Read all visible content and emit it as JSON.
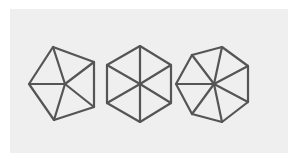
{
  "diagram": {
    "background_color": "#efefef",
    "stroke_color": "#555555",
    "shapes": [
      {
        "name": "pentagon",
        "sides": 5,
        "center": [
          65,
          84
        ],
        "vertices": [
          [
            53,
            47
          ],
          [
            94,
            62
          ],
          [
            94,
            107
          ],
          [
            54,
            120
          ],
          [
            29,
            84
          ]
        ]
      },
      {
        "name": "hexagon",
        "sides": 6,
        "center": [
          140,
          84
        ],
        "vertices": [
          [
            140,
            46
          ],
          [
            171,
            65
          ],
          [
            171,
            103
          ],
          [
            140,
            122
          ],
          [
            107,
            103
          ],
          [
            107,
            65
          ]
        ]
      },
      {
        "name": "heptagon",
        "sides": 7,
        "center": [
          214,
          84
        ],
        "vertices": [
          [
            222,
            47
          ],
          [
            248,
            66
          ],
          [
            248,
            102
          ],
          [
            222,
            122
          ],
          [
            192,
            114
          ],
          [
            176,
            84
          ],
          [
            192,
            55
          ]
        ]
      }
    ]
  }
}
